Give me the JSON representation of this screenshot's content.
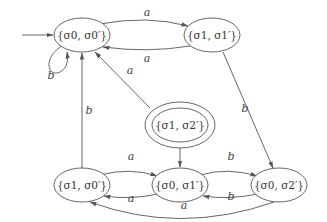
{
  "diagram": {
    "type": "state-machine",
    "colors": {
      "stroke": "#555555",
      "text": "#333333",
      "background": "#ffffff"
    },
    "states": [
      {
        "id": "s00",
        "label": "{σ0, σ0′}",
        "sub1": "0",
        "sub2": "0",
        "first": "σ",
        "initial": true,
        "accepting": false
      },
      {
        "id": "s11",
        "label": "{σ1, σ1′}",
        "sub1": "1",
        "sub2": "1",
        "initial": false,
        "accepting": false
      },
      {
        "id": "s12",
        "label": "{σ1, σ2′}",
        "sub1": "1",
        "sub2": "2",
        "initial": false,
        "accepting": true
      },
      {
        "id": "s10",
        "label": "{σ1, σ0′}",
        "sub1": "1",
        "sub2": "0",
        "initial": false,
        "accepting": false
      },
      {
        "id": "s01",
        "label": "{σ0, σ1′}",
        "sub1": "0",
        "sub2": "1",
        "initial": false,
        "accepting": false
      },
      {
        "id": "s02",
        "label": "{σ0, σ2′}",
        "sub1": "0",
        "sub2": "2",
        "initial": false,
        "accepting": false
      }
    ],
    "transitions": [
      {
        "from": "s00",
        "to": "s11",
        "label": "a"
      },
      {
        "from": "s11",
        "to": "s00",
        "label": "a"
      },
      {
        "from": "s00",
        "to": "s00",
        "label": "b"
      },
      {
        "from": "s11",
        "to": "s02",
        "label": "b"
      },
      {
        "from": "s12",
        "to": "s00",
        "label": "a"
      },
      {
        "from": "s12",
        "to": "s01",
        "label": "b"
      },
      {
        "from": "s10",
        "to": "s00",
        "label": "b"
      },
      {
        "from": "s10",
        "to": "s01",
        "label": "a"
      },
      {
        "from": "s01",
        "to": "s10",
        "label": "a"
      },
      {
        "from": "s01",
        "to": "s02",
        "label": "b"
      },
      {
        "from": "s02",
        "to": "s01",
        "label": "b"
      },
      {
        "from": "s02",
        "to": "s10",
        "label": "a"
      }
    ],
    "text": {
      "lbrace": "{",
      "rbrace": "}",
      "sigma": "σ",
      "comma": ", ",
      "prime": "′",
      "a": "a",
      "b": "b"
    }
  }
}
